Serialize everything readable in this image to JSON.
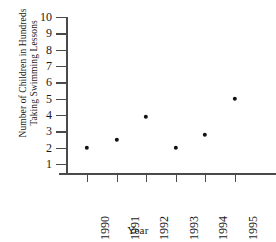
{
  "chart_data": {
    "type": "scatter",
    "title": "",
    "xlabel": "Year",
    "ylabel": "Number of Children in Hundreds Taking Swimming Lessons",
    "ylabel_lines": [
      "Number of Children in Hundreds",
      "Taking Swimming Lessons"
    ],
    "categories": [
      "1990",
      "1991",
      "1992",
      "1993",
      "1994",
      "1995"
    ],
    "x": [
      1990,
      1991,
      1992,
      1993,
      1994,
      1995
    ],
    "values": [
      2,
      2.5,
      3.9,
      2,
      2.8,
      5
    ],
    "ylim": [
      0,
      10
    ],
    "yticks": [
      10,
      9,
      8,
      7,
      6,
      5,
      4,
      3,
      2,
      1
    ],
    "ytick_labels": [
      "10",
      "9",
      "8",
      "7",
      "6",
      "5",
      "4",
      "3",
      "2",
      "1"
    ],
    "xtick_labels": [
      "1990",
      "1991",
      "1992",
      "1993",
      "1994",
      "1995"
    ],
    "grid": false,
    "legend": false,
    "marker": "filled-circle",
    "marker_color": "#111111",
    "axis_color": "#4a4a4a",
    "background": "#ffffff"
  }
}
